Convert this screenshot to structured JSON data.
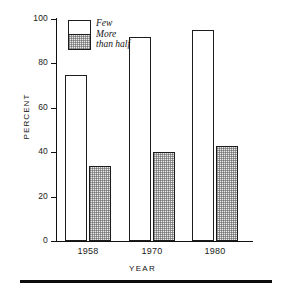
{
  "chart_data": {
    "type": "bar",
    "title": "",
    "subtitle": "",
    "xlabel": "YEAR",
    "ylabel": "PERCENT",
    "categories": [
      "1958",
      "1970",
      "1980"
    ],
    "series": [
      {
        "name": "Few",
        "values": [
          75,
          92,
          95
        ],
        "fill": "white",
        "border": "#1c1c1c"
      },
      {
        "name": "More than half",
        "values": [
          34,
          40,
          43
        ],
        "fill": "stipple-gray",
        "border": "#1c1c1c"
      }
    ],
    "ylim": [
      0,
      100
    ],
    "yticks": [
      0,
      20,
      40,
      60,
      80,
      100
    ],
    "ytick_labels": [
      "0",
      "20",
      "40",
      "60",
      "80",
      "100"
    ],
    "grid": false,
    "legend_position": "top-left-inside",
    "legend_entries": [
      {
        "label": "Few",
        "lines": [
          "Few"
        ]
      },
      {
        "label": "More than half",
        "lines": [
          "More",
          "than half"
        ]
      }
    ],
    "annotations": []
  },
  "axes": {
    "y_axis_title": "PERCENT",
    "x_axis_title": "YEAR",
    "y_ticks": [
      {
        "value": 100,
        "label": "100"
      },
      {
        "value": 80,
        "label": "80"
      },
      {
        "value": 60,
        "label": "60"
      },
      {
        "value": 40,
        "label": "40"
      },
      {
        "value": 20,
        "label": "20"
      },
      {
        "value": 0,
        "label": "0"
      }
    ],
    "x_ticks": [
      {
        "label": "1958"
      },
      {
        "label": "1970"
      },
      {
        "label": "1980"
      }
    ]
  },
  "legend": {
    "few_label": "Few",
    "more_label_line1": "More",
    "more_label_line2": "than half"
  },
  "bars": [
    {
      "group": "1958",
      "series": "Few",
      "value": 75,
      "style": "few"
    },
    {
      "group": "1958",
      "series": "More than half",
      "value": 34,
      "style": "more"
    },
    {
      "group": "1970",
      "series": "Few",
      "value": 92,
      "style": "few"
    },
    {
      "group": "1970",
      "series": "More than half",
      "value": 40,
      "style": "more"
    },
    {
      "group": "1980",
      "series": "Few",
      "value": 95,
      "style": "few"
    },
    {
      "group": "1980",
      "series": "More than half",
      "value": 43,
      "style": "more"
    }
  ],
  "colors": {
    "ink": "#111111",
    "bar_outline": "#1c1c1c",
    "bar_few_fill": "#ffffff",
    "bar_more_fill": "#ececeb",
    "rule": "#0d0d0d",
    "background": "#ffffff"
  }
}
